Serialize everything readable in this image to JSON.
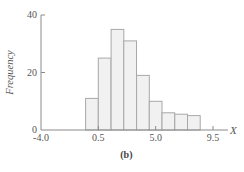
{
  "chart_data": {
    "type": "bar",
    "title": "",
    "caption": "(b)",
    "xlabel": "X",
    "ylabel": "Frequency",
    "xlim": [
      -4.0,
      10.5
    ],
    "ylim": [
      0,
      40
    ],
    "xticks": [
      -4.0,
      0.5,
      5.0,
      9.5
    ],
    "xtick_labels": [
      "-4.0",
      "0.5",
      "5.0",
      "9.5"
    ],
    "yticks": [
      0,
      20,
      40
    ],
    "ytick_labels": [
      "0",
      "20",
      "40"
    ],
    "grid": false,
    "bin_width": 1.0,
    "bins": [
      {
        "start": -0.5,
        "end": 0.5,
        "value": 11
      },
      {
        "start": 0.5,
        "end": 1.5,
        "value": 25
      },
      {
        "start": 1.5,
        "end": 2.5,
        "value": 35
      },
      {
        "start": 2.5,
        "end": 3.5,
        "value": 31
      },
      {
        "start": 3.5,
        "end": 4.5,
        "value": 19
      },
      {
        "start": 4.5,
        "end": 5.5,
        "value": 10
      },
      {
        "start": 5.5,
        "end": 6.5,
        "value": 6
      },
      {
        "start": 6.5,
        "end": 7.5,
        "value": 5.5
      },
      {
        "start": 7.5,
        "end": 8.5,
        "value": 5
      }
    ]
  }
}
